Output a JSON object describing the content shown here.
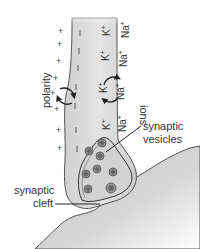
{
  "diagram": {
    "title": "",
    "labels": {
      "polarity": "polarity",
      "ions": "ions",
      "synaptic_vesicles_line1": "synaptic",
      "synaptic_vesicles_line2": "vesicles",
      "synaptic_cleft_line1": "synaptic",
      "synaptic_cleft_line2": "cleft"
    },
    "ions": {
      "k": "K",
      "na": "Na",
      "charge": "+"
    },
    "charges": {
      "outside": "+",
      "inside": "–"
    },
    "colors": {
      "axon_fill": "#d9d9d9",
      "postsynaptic_fill": "#cfcfcf",
      "vesicle_fill": "#777777",
      "outline": "#444444"
    }
  }
}
